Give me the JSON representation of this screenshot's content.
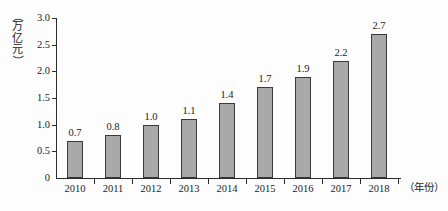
{
  "chart_data": {
    "type": "bar",
    "title": "",
    "subtitle": "",
    "xlabel": "（年份）",
    "ylabel": "（万亿元）",
    "ylabel_chars": [
      "（",
      "万",
      "亿",
      "元",
      "）"
    ],
    "categories": [
      "2010",
      "2011",
      "2012",
      "2013",
      "2014",
      "2015",
      "2016",
      "2017",
      "2018"
    ],
    "values": [
      0.7,
      0.8,
      1.0,
      1.1,
      1.4,
      1.7,
      1.9,
      2.2,
      2.7
    ],
    "value_labels": [
      "0.7",
      "0.8",
      "1.0",
      "1.1",
      "1.4",
      "1.7",
      "1.9",
      "2.2",
      "2.7"
    ],
    "ylim": [
      0,
      3.0
    ],
    "yticks": [
      0,
      0.5,
      1.0,
      1.5,
      2.0,
      2.5,
      3.0
    ],
    "ytick_labels": [
      "0",
      "0.5",
      "1.0",
      "1.5",
      "2.0",
      "2.5",
      "3.0"
    ],
    "grid": false,
    "legend": null,
    "bar_fill_color": "#a9a9a9",
    "bar_border_color": "#3a3a3a",
    "axis_color": "#2b2b2b",
    "background_color": "#fdfdfd"
  }
}
